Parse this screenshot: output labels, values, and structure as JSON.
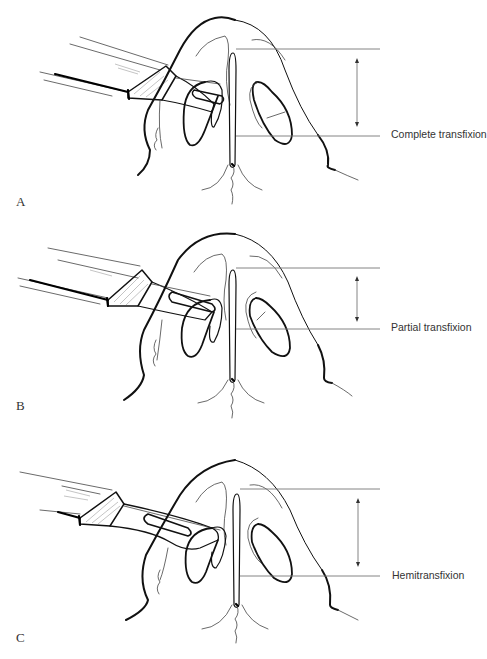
{
  "figure": {
    "panels": [
      {
        "letter": "A",
        "label": "Complete transfixion",
        "incision": "complete"
      },
      {
        "letter": "B",
        "label": "Partial transfixion",
        "incision": "partial"
      },
      {
        "letter": "C",
        "label": "Hemitransfixion",
        "incision": "hemi"
      }
    ]
  },
  "colors": {
    "line": "#111111",
    "guide": "#777777",
    "text": "#333333",
    "background": "#ffffff"
  }
}
